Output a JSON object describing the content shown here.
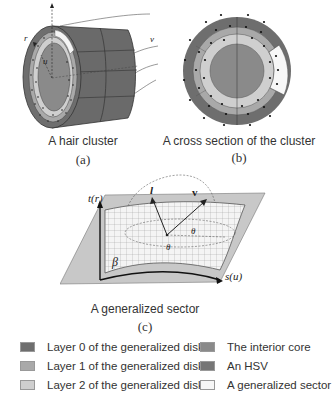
{
  "panels": {
    "a": {
      "caption": "A hair cluster",
      "label": "(a)",
      "axes": {
        "r": "r",
        "u": "u",
        "v": "v"
      }
    },
    "b": {
      "caption": "A cross section of the cluster",
      "label": "(b)"
    },
    "c": {
      "caption": "A generalized sector",
      "label": "(c)",
      "axes": {
        "t": "t(r)",
        "s": "s(u)",
        "beta": "β",
        "l": "l",
        "v": "v",
        "theta1": "θ",
        "theta2": "θ"
      }
    }
  },
  "colors": {
    "layer0": "#6e6e6e",
    "layer1": "#a9a9a9",
    "layer2": "#cfcfcf",
    "core": "#8a8a8a",
    "hsv": "#7a7a7a",
    "sector": "#f7f7f7",
    "plane": "#c8c8c8"
  },
  "legend": [
    {
      "label": "Layer 0 of the generalized disk",
      "color": "#6e6e6e"
    },
    {
      "label": "Layer 1 of the generalized disk",
      "color": "#a9a9a9"
    },
    {
      "label": "Layer 2 of the generalized disk",
      "color": "#cfcfcf"
    },
    {
      "label": "The interior core",
      "color": "#8a8a8a"
    },
    {
      "label": "An HSV",
      "color": "#767676"
    },
    {
      "label": "A generalized sector",
      "color": "#f7f7f7"
    }
  ]
}
